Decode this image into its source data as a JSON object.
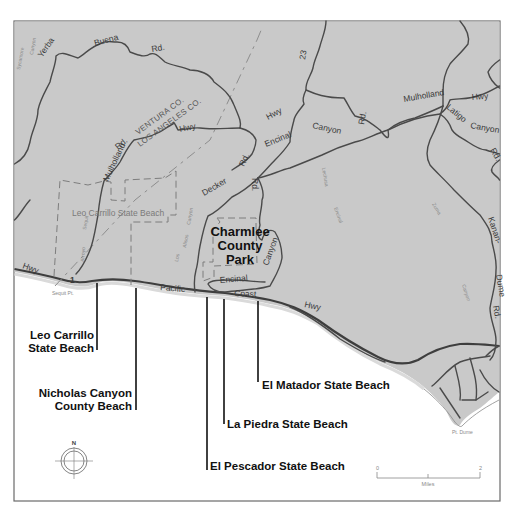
{
  "map": {
    "colors": {
      "land": "#c9c9c9",
      "ocean": "#ffffff",
      "road": "#4a4a4a",
      "boundary": "#7d7d7d",
      "frame": "#6a6a6a",
      "label": "#111111"
    },
    "roads": {
      "yerba": "Yerba",
      "buena": "Buena",
      "rd_1": "Rd.",
      "hwy_mulholland_w": "Hwy",
      "rd_mulholland_w": "Rd.",
      "mulholland_w": "Mulholland",
      "route_23": "23",
      "hwy_23": "Hwy",
      "decker": "Decker",
      "rd_decker": "Rd.",
      "encinal_1": "Encinal",
      "canyon_1": "Canyon",
      "rd_encinal": "Rd.",
      "rd_vertical": "Rd.",
      "mulholland_e": "Mulholland",
      "hwy_e": "Hwy",
      "latigo": "Latigo",
      "canyon_latigo": "Canyon",
      "rd_latigo": "Rd.",
      "kanan": "Kanan-",
      "dume": "Dume",
      "rd_kanan": "Rd.",
      "encinal_2": "Encinal",
      "canyon_2": "Canyon",
      "hwy_pch_w": "Hwy",
      "route_1": "1",
      "pacific": "Pacific",
      "coast": "Coast",
      "hwy_pch_e": "Hwy"
    },
    "county_line": {
      "ventura": "VENTURA CO.",
      "los_angeles": "LOS ANGELES CO."
    },
    "areas": {
      "leo_carrillo_park": "Leo Carrillo State Beach",
      "charmlee": [
        "Charmlee",
        "County",
        "Park"
      ]
    },
    "points": {
      "sequit_pt": "Sequit Pt.",
      "pt_dume": "Pt. Dume"
    },
    "creeks": {
      "sycamore": "Sycamore",
      "canyon_nw": "Canyon",
      "sequit": "Sequit",
      "arroyo": "Arroyo",
      "los": "Los",
      "alisos": "Alisos",
      "canyon_mid": "Canyon",
      "lechusa": "Lechusa",
      "encinal_cr": "Encinal",
      "canyon_e": "Canyon",
      "zuma": "Zuma",
      "canyon_zuma": "Canyon"
    },
    "beaches": [
      {
        "lines": [
          "Leo Carrillo",
          "State Beach"
        ]
      },
      {
        "lines": [
          "Nicholas Canyon",
          "County Beach"
        ]
      },
      {
        "lines": [
          "El Matador State Beach"
        ]
      },
      {
        "lines": [
          "La Piedra State Beach"
        ]
      },
      {
        "lines": [
          "El Pescador State Beach"
        ]
      }
    ],
    "compass": {
      "north": "N"
    },
    "scale_bar": {
      "min": "0",
      "max": "2",
      "unit": "Miles"
    }
  }
}
